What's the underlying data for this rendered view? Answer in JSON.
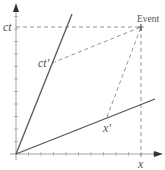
{
  "diagram": {
    "type": "minkowski-spacetime-diagram",
    "labels": {
      "ct": "ct",
      "x": "x",
      "ct_prime": "ct'",
      "x_prime": "x'",
      "event": "Event"
    },
    "colors": {
      "axis": "#888888",
      "primed_axis": "#555555",
      "dashed": "#777777",
      "text": "#555555",
      "background": "#ffffff"
    },
    "geometry": {
      "origin": [
        16,
        154
      ],
      "x_axis_end": [
        162,
        154
      ],
      "ct_axis_end": [
        16,
        3
      ],
      "ct_prime_axis_end": [
        72,
        14
      ],
      "x_prime_axis_end": [
        155,
        99
      ],
      "event_point": [
        141,
        27
      ],
      "ct_prime_point": [
        52,
        63
      ],
      "x_prime_point": [
        107,
        117
      ],
      "tick_spacing": 12.5,
      "tick_count": 10
    }
  }
}
